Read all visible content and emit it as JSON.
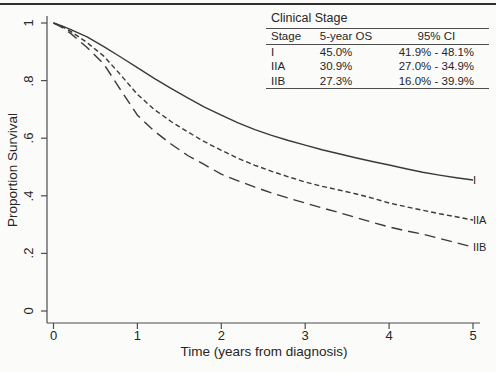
{
  "legend": {
    "title": "Clinical Stage",
    "headers": [
      "Stage",
      "5-year OS",
      "95% CI"
    ],
    "rows": [
      {
        "stage": "I",
        "os": "45.0%",
        "ci": "41.9% - 48.1%"
      },
      {
        "stage": "IIA",
        "os": "30.9%",
        "ci": "27.0% - 34.9%"
      },
      {
        "stage": "IIB",
        "os": "27.3%",
        "ci": "16.0% - 39.9%"
      }
    ]
  },
  "chart_data": {
    "type": "line",
    "title": "",
    "xlabel": "Time (years from diagnosis)",
    "ylabel": "Proportion Survival",
    "xlim": [
      0,
      5
    ],
    "ylim": [
      0,
      1
    ],
    "grid": "off",
    "legend_position": "top-right-table",
    "x_ticks": [
      {
        "value": 0,
        "label": "0"
      },
      {
        "value": 1,
        "label": "1"
      },
      {
        "value": 2,
        "label": "2"
      },
      {
        "value": 3,
        "label": "3"
      },
      {
        "value": 4,
        "label": "4"
      },
      {
        "value": 5,
        "label": "5"
      }
    ],
    "y_ticks": [
      {
        "value": 0,
        "label": "0"
      },
      {
        "value": 0.2,
        "label": ".2"
      },
      {
        "value": 0.4,
        "label": ".4"
      },
      {
        "value": 0.6,
        "label": ".6"
      },
      {
        "value": 0.8,
        "label": ".8"
      },
      {
        "value": 1,
        "label": "1"
      }
    ],
    "series": [
      {
        "name": "Stage I",
        "label": "I",
        "style": "solid",
        "five_year_os": "45.0%",
        "ci_95": "41.9% - 48.1%",
        "points": [
          [
            0,
            1.0
          ],
          [
            0.1,
            0.99
          ],
          [
            0.2,
            0.978
          ],
          [
            0.4,
            0.952
          ],
          [
            0.6,
            0.918
          ],
          [
            0.8,
            0.882
          ],
          [
            1.0,
            0.845
          ],
          [
            1.2,
            0.808
          ],
          [
            1.4,
            0.773
          ],
          [
            1.6,
            0.74
          ],
          [
            1.8,
            0.708
          ],
          [
            2.0,
            0.68
          ],
          [
            2.2,
            0.653
          ],
          [
            2.4,
            0.63
          ],
          [
            2.6,
            0.61
          ],
          [
            2.8,
            0.592
          ],
          [
            3.0,
            0.576
          ],
          [
            3.2,
            0.56
          ],
          [
            3.4,
            0.546
          ],
          [
            3.6,
            0.532
          ],
          [
            3.8,
            0.519
          ],
          [
            4.0,
            0.507
          ],
          [
            4.2,
            0.494
          ],
          [
            4.4,
            0.482
          ],
          [
            4.6,
            0.472
          ],
          [
            4.8,
            0.463
          ],
          [
            5.0,
            0.455
          ]
        ]
      },
      {
        "name": "Stage IIA",
        "label": "IIA",
        "style": "dash",
        "five_year_os": "30.9%",
        "ci_95": "27.0% - 34.9%",
        "points": [
          [
            0,
            1.0
          ],
          [
            0.1,
            0.988
          ],
          [
            0.2,
            0.972
          ],
          [
            0.4,
            0.932
          ],
          [
            0.6,
            0.885
          ],
          [
            0.8,
            0.82
          ],
          [
            1.0,
            0.752
          ],
          [
            1.2,
            0.7
          ],
          [
            1.4,
            0.658
          ],
          [
            1.6,
            0.622
          ],
          [
            1.8,
            0.588
          ],
          [
            2.0,
            0.558
          ],
          [
            2.2,
            0.53
          ],
          [
            2.4,
            0.506
          ],
          [
            2.6,
            0.485
          ],
          [
            2.8,
            0.466
          ],
          [
            3.0,
            0.448
          ],
          [
            3.2,
            0.433
          ],
          [
            3.4,
            0.42
          ],
          [
            3.6,
            0.407
          ],
          [
            3.8,
            0.392
          ],
          [
            4.0,
            0.375
          ],
          [
            4.2,
            0.362
          ],
          [
            4.4,
            0.35
          ],
          [
            4.6,
            0.338
          ],
          [
            4.8,
            0.327
          ],
          [
            5.0,
            0.316
          ]
        ]
      },
      {
        "name": "Stage IIB",
        "label": "IIB",
        "style": "longdash",
        "five_year_os": "27.3%",
        "ci_95": "16.0% - 39.9%",
        "points": [
          [
            0,
            1.0
          ],
          [
            0.1,
            0.985
          ],
          [
            0.2,
            0.965
          ],
          [
            0.4,
            0.915
          ],
          [
            0.6,
            0.858
          ],
          [
            0.8,
            0.768
          ],
          [
            1.0,
            0.68
          ],
          [
            1.2,
            0.625
          ],
          [
            1.4,
            0.58
          ],
          [
            1.6,
            0.54
          ],
          [
            1.8,
            0.508
          ],
          [
            2.0,
            0.475
          ],
          [
            2.2,
            0.452
          ],
          [
            2.4,
            0.43
          ],
          [
            2.6,
            0.41
          ],
          [
            2.8,
            0.392
          ],
          [
            3.0,
            0.375
          ],
          [
            3.2,
            0.358
          ],
          [
            3.4,
            0.342
          ],
          [
            3.6,
            0.325
          ],
          [
            3.8,
            0.308
          ],
          [
            4.0,
            0.292
          ],
          [
            4.2,
            0.278
          ],
          [
            4.4,
            0.267
          ],
          [
            4.6,
            0.252
          ],
          [
            4.8,
            0.237
          ],
          [
            5.0,
            0.222
          ]
        ]
      }
    ]
  }
}
